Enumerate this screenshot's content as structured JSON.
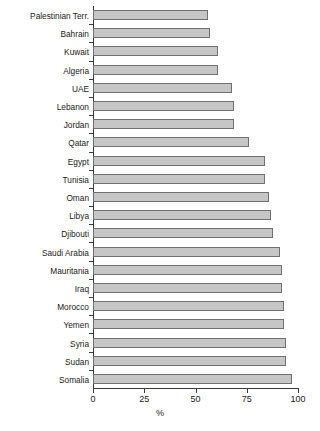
{
  "chart_data": {
    "type": "bar",
    "orientation": "horizontal",
    "title": "",
    "subtitle": "",
    "xlabel": "%",
    "ylabel": "",
    "xlim": [
      0,
      100
    ],
    "xticks": [
      0,
      25,
      50,
      75,
      100
    ],
    "xtick_labels": [
      "0",
      "25",
      "50",
      "75",
      "100"
    ],
    "grid": false,
    "legend": false,
    "legend_position": "none",
    "bar_fill_color": "#c6c6c6",
    "bar_border_color": "#707070",
    "axis_color": "#3a3a3a",
    "text_color": "#1a1a1a",
    "categories": [
      "Palestinian Terr.",
      "Bahrain",
      "Kuwait",
      "Algeria",
      "UAE",
      "Lebanon",
      "Jordan",
      "Qatar",
      "Egypt",
      "Tunisia",
      "Oman",
      "Libya",
      "Djibouti",
      "Saudi Arabia",
      "Mauritania",
      "Iraq",
      "Morocco",
      "Yemen",
      "Syria",
      "Sudan",
      "Somalia"
    ],
    "values": [
      56,
      57,
      61,
      61,
      68,
      69,
      69,
      76,
      84,
      84,
      86,
      87,
      88,
      91,
      92,
      92,
      93,
      93,
      94,
      94,
      97
    ]
  }
}
